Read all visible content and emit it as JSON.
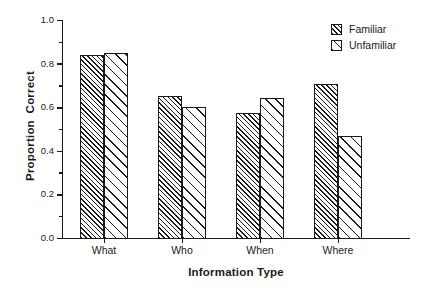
{
  "chart_data": {
    "type": "bar",
    "title": "",
    "subtitle": "",
    "xlabel": "Information Type",
    "ylabel": "Proportion  Correct",
    "categories": [
      "What",
      "Who",
      "When",
      "Where"
    ],
    "series": [
      {
        "name": "Familiar",
        "values": [
          0.84,
          0.65,
          0.575,
          0.705
        ],
        "hatch": "hatch-dense",
        "swatch_name": "familiar-swatch"
      },
      {
        "name": "Unfamiliar",
        "values": [
          0.85,
          0.6,
          0.64,
          0.47
        ],
        "hatch": "hatch-sparse",
        "swatch_name": "unfamiliar-swatch"
      }
    ],
    "ylim": [
      0.0,
      1.0
    ],
    "ytick_labels": [
      "1.0",
      "0.8",
      "0.6",
      "0.4",
      "0.2",
      "0.0"
    ],
    "ytick_values": [
      1.0,
      0.8,
      0.6,
      0.4,
      0.2,
      0.0
    ],
    "yminor_values": [
      0.9,
      0.7,
      0.5,
      0.3,
      0.1
    ],
    "grid": false,
    "legend_position": "top-right",
    "legend_entries": [
      "Familiar",
      "Unfamiliar"
    ],
    "colors": {
      "line": "#1a1a1a",
      "bar_fill": "#ffffff",
      "hatch": "#1a1a1a",
      "background": "#ffffff",
      "text": "#1a1a1a"
    }
  },
  "axes": {
    "y_title": "Proportion  Correct",
    "x_title": "Information Type"
  },
  "legend": {
    "items": [
      {
        "label": "Familiar"
      },
      {
        "label": "Unfamiliar"
      }
    ]
  }
}
